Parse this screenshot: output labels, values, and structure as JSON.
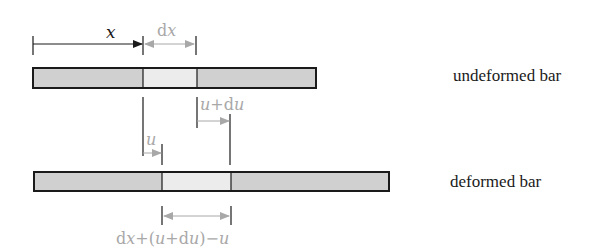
{
  "colors": {
    "outline": "#1a1a1a",
    "bar_fill": "#d0d0d0",
    "element_fill": "#ececec",
    "annotation_gray": "#a8a8a8",
    "black_arrow": "#1a1a1a"
  },
  "labels": {
    "x": "x",
    "dx": "dx",
    "u_plus_du": "u+du",
    "u": "u",
    "deformed_length": "dx+(u+du)−u",
    "undeformed_bar": "undeformed bar",
    "deformed_bar": "deformed bar"
  },
  "geometry": {
    "undeformed": {
      "x0": 33,
      "x1": 316,
      "y0": 68,
      "y1": 88,
      "elem_x0": 143,
      "elem_x1": 197
    },
    "deformed": {
      "x0": 34,
      "x1": 389,
      "y0": 172,
      "y1": 191,
      "elem_x0": 162,
      "elem_x1": 231
    }
  }
}
